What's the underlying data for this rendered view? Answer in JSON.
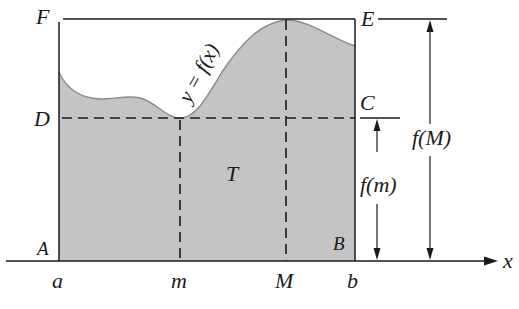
{
  "figure": {
    "curve_label": "y = f(x)",
    "region_label": "T",
    "points": {
      "F": "F",
      "E": "E",
      "D": "D",
      "C": "C",
      "A": "A",
      "B": "B"
    },
    "x_ticks": {
      "a": "a",
      "m": "m",
      "M": "M",
      "b": "b"
    },
    "axis_label": "x",
    "dimension_labels": {
      "f_m": "f(m)",
      "f_M": "f(M)"
    },
    "colors": {
      "fill": "#c4c4c4",
      "stroke": "#1a1a1a",
      "curve": "#8a8a8a",
      "background": "#ffffff"
    }
  }
}
